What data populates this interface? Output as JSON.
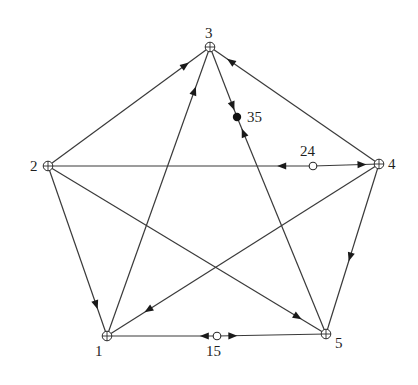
{
  "diagram": {
    "type": "directed-graph",
    "nodes": [
      {
        "id": "1",
        "label": "1",
        "x": 107,
        "y": 336,
        "label_dx": -12,
        "label_dy": 20,
        "style": "crossed-circle"
      },
      {
        "id": "2",
        "label": "2",
        "x": 48,
        "y": 166,
        "label_dx": -18,
        "label_dy": 5,
        "style": "crossed-circle"
      },
      {
        "id": "3",
        "label": "3",
        "x": 210,
        "y": 47,
        "label_dx": -5,
        "label_dy": -9,
        "style": "crossed-circle"
      },
      {
        "id": "4",
        "label": "4",
        "x": 379,
        "y": 164,
        "label_dx": 9,
        "label_dy": 5,
        "style": "crossed-circle"
      },
      {
        "id": "5",
        "label": "5",
        "x": 326,
        "y": 334,
        "label_dx": 9,
        "label_dy": 14,
        "style": "crossed-circle"
      }
    ],
    "midpoints": [
      {
        "id": "35",
        "label": "35",
        "x": 237,
        "y": 117,
        "style": "filled",
        "label_dx": 10,
        "label_dy": 5
      },
      {
        "id": "24",
        "label": "24",
        "x": 313,
        "y": 166,
        "style": "open",
        "label_dx": -13,
        "label_dy": -10
      },
      {
        "id": "15",
        "label": "15",
        "x": 217,
        "y": 336,
        "style": "open",
        "label_dx": -11,
        "label_dy": 20
      }
    ],
    "edges": [
      {
        "from": "2",
        "to": "3",
        "arrow_at": 0.85
      },
      {
        "from": "1",
        "to": "3",
        "arrow_at": 0.85
      },
      {
        "from": "4",
        "to": "3",
        "arrow_at": 0.88
      },
      {
        "from": "2",
        "to": "1",
        "arrow_at": 0.82
      },
      {
        "from": "4",
        "to": "1",
        "arrow_at": 0.85
      },
      {
        "from": "2",
        "to": "5",
        "arrow_at": 0.9
      },
      {
        "from": "4",
        "to": "5",
        "arrow_at": 0.55
      },
      {
        "from": "3",
        "to": "35",
        "arrow_at": 0.85
      },
      {
        "from": "5",
        "to": "35",
        "arrow_at": 0.93
      },
      {
        "from": "24",
        "to": "2",
        "arrow_at": 0.12
      },
      {
        "from": "24",
        "to": "4",
        "arrow_at": 0.75
      },
      {
        "from": "15",
        "to": "1",
        "arrow_at": 0.12
      },
      {
        "from": "15",
        "to": "5",
        "arrow_at": 0.15
      }
    ]
  }
}
